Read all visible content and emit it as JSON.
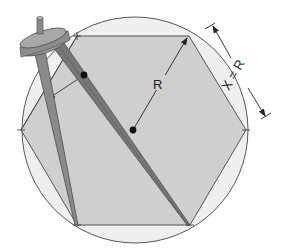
{
  "diagram": {
    "labels": {
      "radius": "R",
      "side_equation": "X = R"
    },
    "colors": {
      "background": "#ffffff",
      "circle_fill": "#efefef",
      "hexagon_fill": "#cfcfcf",
      "stroke": "#444444",
      "compass_leg": "#8a8a8a",
      "compass_leg_dark": "#6e6e6e",
      "compass_head": "#9a9a9a",
      "dot": "#111111"
    },
    "circle": {
      "cx": 135,
      "cy": 130,
      "r": 113
    },
    "hexagon_vertices": [
      [
        77,
        36
      ],
      [
        189,
        36
      ],
      [
        246,
        130
      ],
      [
        190,
        225
      ],
      [
        77,
        225
      ],
      [
        21,
        130
      ]
    ],
    "center_point": [
      133,
      130
    ],
    "radius_arrow_end": [
      188,
      37
    ]
  }
}
